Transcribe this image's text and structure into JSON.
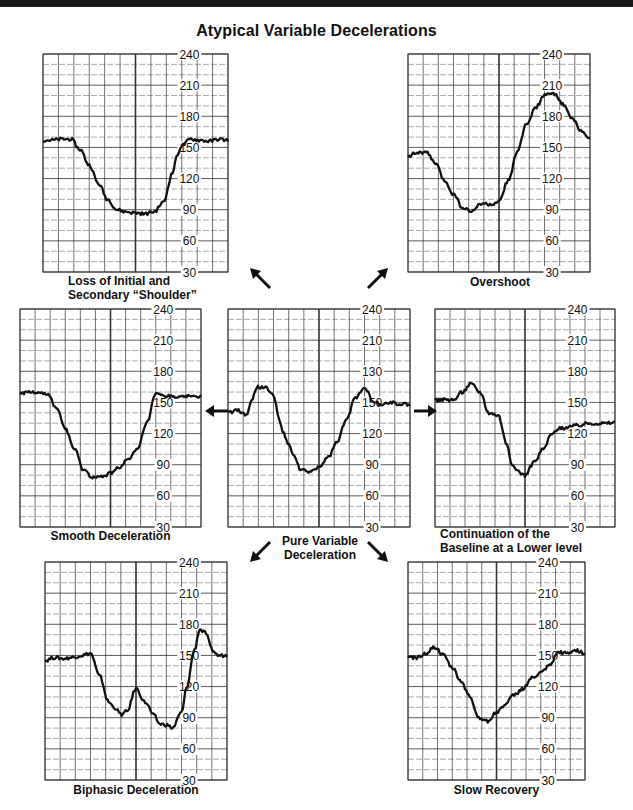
{
  "title": "Atypical Variable Decelerations",
  "chart_data": [
    {
      "id": "loss-of-shoulder",
      "type": "line",
      "title": "Loss of Initial and Secondary “Shoulder”",
      "caption_lines": [
        "Loss of Initial and",
        "Secondary “Shoulder”"
      ],
      "ylabel": "FHR (bpm)",
      "ylim": [
        30,
        240
      ],
      "yticks": [
        30,
        60,
        90,
        120,
        150,
        180,
        210,
        240
      ],
      "ytick_labels": [
        "30",
        "60",
        "90",
        "120",
        "150",
        "180",
        "210",
        "240"
      ],
      "grid": true,
      "x": [
        0,
        0.05,
        0.1,
        0.15,
        0.2,
        0.25,
        0.3,
        0.35,
        0.4,
        0.45,
        0.5,
        0.55,
        0.6,
        0.65,
        0.7,
        0.72,
        0.75,
        0.8,
        0.85,
        0.9,
        0.95,
        1.0
      ],
      "y": [
        157,
        157,
        158,
        158,
        148,
        133,
        115,
        100,
        90,
        88,
        87,
        86,
        88,
        97,
        125,
        140,
        152,
        158,
        157,
        156,
        158,
        157
      ]
    },
    {
      "id": "overshoot",
      "type": "line",
      "title": "Overshoot",
      "caption_lines": [
        "Overshoot"
      ],
      "ylim": [
        30,
        240
      ],
      "yticks": [
        30,
        60,
        90,
        120,
        150,
        180,
        210,
        240
      ],
      "ytick_labels": [
        "30",
        "60",
        "90",
        "120",
        "150",
        "180",
        "210",
        "240"
      ],
      "grid": true,
      "x": [
        0,
        0.05,
        0.1,
        0.15,
        0.2,
        0.25,
        0.3,
        0.35,
        0.4,
        0.45,
        0.5,
        0.55,
        0.6,
        0.65,
        0.7,
        0.75,
        0.8,
        0.85,
        0.9,
        0.95,
        1.0
      ],
      "y": [
        142,
        145,
        145,
        135,
        118,
        105,
        92,
        88,
        96,
        95,
        97,
        118,
        145,
        172,
        188,
        200,
        202,
        192,
        178,
        167,
        158
      ]
    },
    {
      "id": "smooth-deceleration",
      "type": "line",
      "title": "Smooth Deceleration",
      "caption_lines": [
        "Smooth Deceleration"
      ],
      "ylim": [
        30,
        240
      ],
      "yticks": [
        30,
        60,
        90,
        120,
        150,
        180,
        210,
        240
      ],
      "ytick_labels": [
        "30",
        "60",
        "90",
        "120",
        "150",
        "180",
        "210",
        "240"
      ],
      "grid": true,
      "x": [
        0,
        0.05,
        0.1,
        0.15,
        0.2,
        0.25,
        0.3,
        0.35,
        0.4,
        0.45,
        0.5,
        0.55,
        0.6,
        0.65,
        0.7,
        0.75,
        0.8,
        0.85,
        0.9,
        0.95,
        1.0
      ],
      "y": [
        159,
        160,
        160,
        158,
        145,
        125,
        105,
        85,
        78,
        78,
        82,
        88,
        95,
        105,
        130,
        158,
        156,
        156,
        155,
        156,
        156
      ]
    },
    {
      "id": "pure-variable-deceleration",
      "type": "line",
      "title": "Pure Variable Deceleration",
      "caption_lines": [
        "Pure Variable",
        "Deceleration"
      ],
      "ylim": [
        30,
        240
      ],
      "yticks": [
        30,
        60,
        90,
        120,
        150,
        180,
        210,
        240
      ],
      "ytick_labels": [
        "30",
        "60",
        "90",
        "120",
        "150",
        "130",
        "210",
        "240"
      ],
      "grid": true,
      "x": [
        0,
        0.05,
        0.1,
        0.13,
        0.16,
        0.2,
        0.25,
        0.28,
        0.3,
        0.33,
        0.36,
        0.4,
        0.45,
        0.5,
        0.55,
        0.6,
        0.65,
        0.7,
        0.75,
        0.8,
        0.85,
        0.9,
        0.95,
        1.0
      ],
      "y": [
        140,
        143,
        138,
        152,
        165,
        165,
        157,
        135,
        122,
        110,
        100,
        85,
        83,
        88,
        97,
        112,
        133,
        155,
        165,
        150,
        148,
        150,
        148,
        148
      ]
    },
    {
      "id": "continuation-lower-baseline",
      "type": "line",
      "title": "Continuation of the Baseline at a Lower level",
      "caption_lines": [
        "Continuation of the",
        "Baseline at a Lower level"
      ],
      "ylim": [
        30,
        240
      ],
      "yticks": [
        30,
        60,
        90,
        120,
        150,
        180,
        210,
        240
      ],
      "ytick_labels": [
        "30",
        "60",
        "90",
        "120",
        "150",
        "180",
        "210",
        "240"
      ],
      "grid": true,
      "x": [
        0,
        0.05,
        0.1,
        0.15,
        0.2,
        0.25,
        0.3,
        0.35,
        0.4,
        0.43,
        0.45,
        0.5,
        0.55,
        0.6,
        0.65,
        0.7,
        0.75,
        0.8,
        0.85,
        0.9,
        0.95,
        1.0
      ],
      "y": [
        152,
        153,
        152,
        160,
        168,
        160,
        140,
        138,
        110,
        88,
        85,
        80,
        92,
        105,
        120,
        125,
        127,
        128,
        130,
        130,
        130,
        131
      ]
    },
    {
      "id": "biphasic-deceleration",
      "type": "line",
      "title": "Biphasic Deceleration",
      "caption_lines": [
        "Biphasic Deceleration"
      ],
      "ylim": [
        30,
        240
      ],
      "yticks": [
        30,
        60,
        90,
        120,
        150,
        180,
        210,
        240
      ],
      "ytick_labels": [
        "30",
        "60",
        "90",
        "120",
        "150",
        "180",
        "210",
        "240"
      ],
      "grid": true,
      "x": [
        0,
        0.05,
        0.1,
        0.15,
        0.2,
        0.25,
        0.3,
        0.35,
        0.38,
        0.42,
        0.45,
        0.5,
        0.55,
        0.6,
        0.63,
        0.67,
        0.7,
        0.75,
        0.78,
        0.82,
        0.85,
        0.88,
        0.92,
        0.95,
        1.0
      ],
      "y": [
        145,
        148,
        147,
        148,
        150,
        152,
        130,
        105,
        100,
        93,
        96,
        118,
        105,
        92,
        84,
        83,
        80,
        95,
        120,
        155,
        175,
        172,
        155,
        150,
        150
      ]
    },
    {
      "id": "slow-recovery",
      "type": "line",
      "title": "Slow Recovery",
      "caption_lines": [
        "Slow Recovery"
      ],
      "ylim": [
        30,
        240
      ],
      "yticks": [
        30,
        60,
        90,
        120,
        150,
        180,
        210,
        240
      ],
      "ytick_labels": [
        "30",
        "60",
        "90",
        "120",
        "150",
        "180",
        "210",
        "240"
      ],
      "grid": true,
      "x": [
        0,
        0.05,
        0.1,
        0.15,
        0.2,
        0.25,
        0.3,
        0.35,
        0.4,
        0.45,
        0.5,
        0.55,
        0.6,
        0.65,
        0.7,
        0.75,
        0.8,
        0.85,
        0.9,
        0.95,
        1.0
      ],
      "y": [
        148,
        148,
        152,
        158,
        150,
        138,
        125,
        110,
        90,
        87,
        95,
        103,
        112,
        118,
        128,
        133,
        140,
        153,
        152,
        155,
        152
      ]
    }
  ],
  "arrows": [
    {
      "from": "pure-variable-deceleration",
      "to": "loss-of-shoulder",
      "direction": "up-left"
    },
    {
      "from": "pure-variable-deceleration",
      "to": "overshoot",
      "direction": "up-right"
    },
    {
      "from": "pure-variable-deceleration",
      "to": "smooth-deceleration",
      "direction": "left"
    },
    {
      "from": "pure-variable-deceleration",
      "to": "continuation-lower-baseline",
      "direction": "right"
    },
    {
      "from": "pure-variable-deceleration",
      "to": "biphasic-deceleration",
      "direction": "down-left"
    },
    {
      "from": "pure-variable-deceleration",
      "to": "slow-recovery",
      "direction": "down-right"
    }
  ],
  "colors": {
    "ink": "#111111",
    "grid": "#333333",
    "grid_minor": "#777777",
    "paper": "#ffffff"
  }
}
